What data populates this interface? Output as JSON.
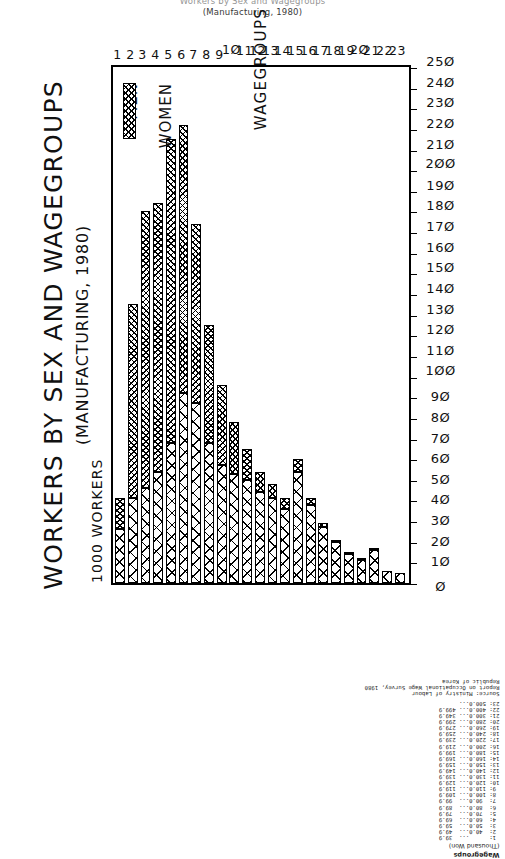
{
  "caption": {
    "line1": "Workers by Sex and Wagegroups",
    "line2": "(Manufacturing, 1980)"
  },
  "chart_titles": {
    "main": "WORKERS BY SEX AND WAGEGROUPS",
    "sub": "(MANUFACTURING, 1980)"
  },
  "axes": {
    "value_axis_title": "1000 WORKERS",
    "group_axis_title": "WAGEGROUPS",
    "value_ticks": [
      "0",
      "10",
      "20",
      "30",
      "40",
      "50",
      "60",
      "70",
      "80",
      "90",
      "100",
      "110",
      "120",
      "130",
      "140",
      "150",
      "160",
      "170",
      "180",
      "190",
      "200",
      "210",
      "220",
      "230",
      "240",
      "250"
    ],
    "group_ticks": [
      "1",
      "2",
      "3",
      "4",
      "5",
      "6",
      "7",
      "8",
      "9",
      "10",
      "11",
      "12",
      "13",
      "14",
      "15",
      "16",
      "17",
      "18",
      "19",
      "20",
      "21",
      "22",
      "23"
    ]
  },
  "legend": {
    "items": [
      {
        "label": "MEN",
        "pattern": "sparse-cross-hatch"
      },
      {
        "label": "WOMEN",
        "pattern": "dense-cross-hatch"
      }
    ]
  },
  "key": {
    "title": "Wagegroups",
    "unit": "(Thousand Won)",
    "rows": [
      " 1:      ...  39.9",
      " 2:  40.0...  49.9",
      " 3:  50.0...  59.9",
      " 4:  60.0...  69.9",
      " 5:  70.0...  79.9",
      " 6:  80.0...  89.9",
      " 7:  90.0...  99.9",
      " 8: 100.0... 109.9",
      " 9: 110.0... 119.9",
      "10: 120.0... 129.9",
      "11: 130.0... 139.9",
      "12: 140.0... 149.9",
      "13: 150.0... 159.9",
      "14: 160.0... 169.9",
      "15: 180.0... 199.9",
      "16: 200.0... 219.9",
      "17: 220.0... 239.9",
      "18: 240.0... 259.9",
      "19: 260.0... 279.9",
      "20: 280.0... 299.9",
      "21: 300.0... 349.9",
      "22: 400.0... 499.9",
      "23: 500.0..."
    ]
  },
  "source": {
    "line1": "Source: Ministry of Labour",
    "line2": "Report on Occupational Wage Survey, 1980",
    "line3": "Republic of Korea"
  },
  "chart_data": {
    "type": "bar",
    "orientation": "horizontal-stacked",
    "title": "WORKERS BY SEX AND WAGEGROUPS (MANUFACTURING, 1980)",
    "xlabel": "1000 WORKERS",
    "ylabel": "WAGEGROUPS",
    "xlim": [
      0,
      250
    ],
    "grid": false,
    "legend_position": "inside-top-right",
    "categories": [
      "1",
      "2",
      "3",
      "4",
      "5",
      "6",
      "7",
      "8",
      "9",
      "10",
      "11",
      "12",
      "13",
      "14",
      "15",
      "16",
      "17",
      "18",
      "19",
      "20",
      "21",
      "22",
      "23"
    ],
    "series": [
      {
        "name": "MEN",
        "color": "#ffffff",
        "pattern": "sparse-cross-hatch",
        "values": [
          26,
          41,
          46,
          54,
          68,
          92,
          87,
          68,
          57,
          53,
          50,
          44,
          41,
          36,
          54,
          38,
          27,
          20,
          14,
          11,
          16,
          6,
          5
        ]
      },
      {
        "name": "WOMEN",
        "color": "#ffffff",
        "pattern": "dense-cross-hatch",
        "values": [
          15,
          94,
          134,
          130,
          147,
          130,
          87,
          57,
          39,
          25,
          15,
          10,
          7,
          5,
          6,
          3,
          2,
          1,
          1,
          1,
          1,
          0,
          0
        ]
      }
    ],
    "totals": [
      41,
      135,
      180,
      184,
      215,
      222,
      174,
      125,
      96,
      78,
      65,
      54,
      48,
      41,
      60,
      41,
      29,
      21,
      15,
      12,
      17,
      6,
      5
    ]
  }
}
